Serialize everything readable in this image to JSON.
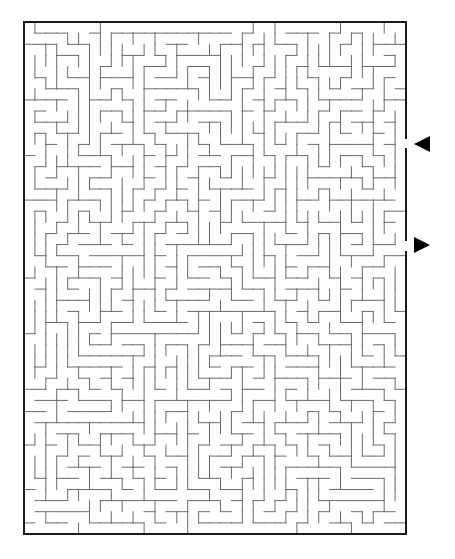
{
  "puzzle": {
    "type": "maze",
    "grid": {
      "cols": 35,
      "rows": 46
    },
    "frame": {
      "left": 24,
      "top": 22,
      "right": 406,
      "bottom": 534
    },
    "colors": {
      "border": "#1a1a1a",
      "walls": "#6a6a6a",
      "arrows": "#000000",
      "background": "#ffffff"
    },
    "openings": [
      {
        "side": "right",
        "row": 11,
        "y_top": 138,
        "y_bottom": 149,
        "role": "entrance"
      },
      {
        "side": "right",
        "row": 20,
        "y_top": 240,
        "y_bottom": 252,
        "role": "exit"
      }
    ],
    "arrows": [
      {
        "name": "entrance-arrow",
        "direction": "left",
        "x_tip": 414,
        "x_base": 430,
        "y_center": 144
      },
      {
        "name": "exit-arrow",
        "direction": "right",
        "x_tip": 430,
        "x_base": 414,
        "y_center": 245
      }
    ]
  }
}
